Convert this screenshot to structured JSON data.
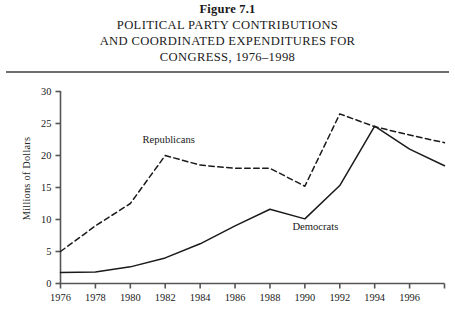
{
  "figure": {
    "number_label": "Figure 7.1",
    "title_lines": [
      "POLITICAL PARTY CONTRIBUTIONS",
      "AND COORDINATED EXPENDITURES FOR",
      "CONGRESS, 1976–1998"
    ]
  },
  "chart_data": {
    "type": "line",
    "title": "POLITICAL PARTY CONTRIBUTIONS AND COORDINATED EXPENDITURES FOR CONGRESS, 1976–1998",
    "xlabel": "",
    "ylabel": "Millions of Dollars",
    "x": [
      1976,
      1978,
      1980,
      1982,
      1984,
      1986,
      1988,
      1990,
      1992,
      1994,
      1996,
      1998
    ],
    "categories": [
      "1976",
      "1978",
      "1980",
      "1982",
      "1984",
      "1986",
      "1988",
      "1990",
      "1992",
      "1994",
      "1996",
      "1998"
    ],
    "xtick_labels": [
      "1976",
      "1978",
      "1980",
      "1982",
      "1984",
      "1986",
      "1988",
      "1990",
      "1992",
      "1994",
      "1996"
    ],
    "ytick_labels": [
      "0",
      "5",
      "10",
      "15",
      "20",
      "25",
      "30"
    ],
    "ytick_values": [
      0,
      5,
      10,
      15,
      20,
      25,
      30
    ],
    "xlim": [
      1976,
      1998
    ],
    "ylim": [
      0,
      30
    ],
    "grid": false,
    "legend": "inline-annotations",
    "series": [
      {
        "name": "Republicans",
        "style": "dashed",
        "color": "#1a1a1a",
        "values": [
          5.0,
          9.0,
          12.5,
          20.0,
          18.5,
          18.0,
          18.0,
          15.2,
          26.5,
          24.5,
          23.2,
          22.0
        ]
      },
      {
        "name": "Democrats",
        "style": "solid",
        "color": "#1a1a1a",
        "values": [
          1.7,
          1.8,
          2.6,
          4.0,
          6.2,
          9.0,
          11.6,
          10.1,
          15.3,
          24.6,
          21.0,
          18.4
        ]
      }
    ],
    "annotations": [
      {
        "text": "Republicans",
        "x": 1982.2,
        "y": 21.9
      },
      {
        "text": "Democrats",
        "x": 1990.6,
        "y": 8.3
      }
    ]
  },
  "axis": {
    "y_axis_title": "Millions of Dollars"
  }
}
